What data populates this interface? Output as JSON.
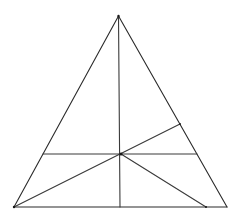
{
  "diagram": {
    "type": "geometry",
    "colors": {
      "background": "#ffffff",
      "stroke": "#2a2a2a"
    },
    "points": {
      "A_apex": [
        118.5,
        16
      ],
      "B_bottom_left": [
        14,
        207
      ],
      "C_bottom_right": [
        227,
        207
      ],
      "P_interior": [
        121,
        154
      ],
      "D_base_foot": [
        120,
        207
      ],
      "E_right_side": [
        180,
        124
      ],
      "F_base_right": [
        206,
        207
      ],
      "G_left_side": [
        43,
        154
      ],
      "H_right_side": [
        197,
        154
      ]
    },
    "segments": [
      {
        "name": "side-AB",
        "from": "A_apex",
        "to": "B_bottom_left"
      },
      {
        "name": "side-AC",
        "from": "A_apex",
        "to": "C_bottom_right"
      },
      {
        "name": "side-BC",
        "from": "B_bottom_left",
        "to": "C_bottom_right"
      },
      {
        "name": "vertical-AD",
        "from": "A_apex",
        "to": "D_base_foot"
      },
      {
        "name": "horizontal-GH",
        "from": "G_left_side",
        "to": "H_right_side"
      },
      {
        "name": "cevian-BE",
        "from": "B_bottom_left",
        "to": "E_right_side"
      },
      {
        "name": "segment-PF",
        "from": "P_interior",
        "to": "F_base_right"
      }
    ]
  }
}
